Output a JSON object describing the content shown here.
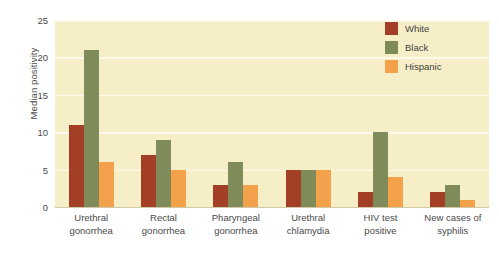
{
  "chart_data": {
    "type": "bar",
    "title": "",
    "xlabel": "",
    "ylabel": "Median positivity",
    "ylim": [
      0,
      25
    ],
    "yticks": [
      0,
      5,
      10,
      15,
      20,
      25
    ],
    "grid": true,
    "legend_position": "top-right",
    "categories": [
      "Urethral gonorrhea",
      "Rectal gonorrhea",
      "Pharyngeal gonorrhea",
      "Urethral chlamydia",
      "HIV test positive",
      "New cases of syphilis"
    ],
    "category_lines": [
      [
        "Urethral",
        "gonorrhea"
      ],
      [
        "Rectal",
        "gonorrhea"
      ],
      [
        "Pharyngeal",
        "gonorrhea"
      ],
      [
        "Urethral",
        "chlamydia"
      ],
      [
        "HIV test",
        "positive"
      ],
      [
        "New cases of",
        "syphilis"
      ]
    ],
    "series": [
      {
        "name": "White",
        "color": "#a33f26",
        "values": [
          11,
          7,
          3,
          5,
          2,
          2
        ]
      },
      {
        "name": "Black",
        "color": "#7f8b58",
        "values": [
          21,
          9,
          6,
          5,
          10,
          3
        ]
      },
      {
        "name": "Hispanic",
        "color": "#f4a14c",
        "values": [
          6,
          5,
          3,
          5,
          4,
          1
        ]
      }
    ]
  },
  "colors": {
    "plot_background": "#f6eec6",
    "gridline": "#fdfaec",
    "axis_line": "#cfc9a8",
    "text": "#4a4a4a",
    "page_background": "#ffffff"
  }
}
